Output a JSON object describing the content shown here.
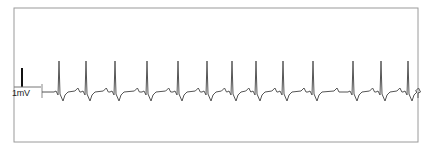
{
  "chart_data": {
    "type": "line",
    "title": "",
    "xlabel": "",
    "ylabel": "",
    "calibration": {
      "label": "1mV",
      "height_px": 19
    },
    "grid": false,
    "legend": null,
    "frame": {
      "left": 14,
      "top": 8,
      "right": 418,
      "bottom": 142
    },
    "baseline_y": 92,
    "trace_start_x": 42,
    "trace_end_x": 418,
    "beats_x": [
      59,
      86,
      115,
      147,
      178,
      207,
      232,
      256,
      283,
      313,
      353,
      381,
      408
    ],
    "beat_morphology": {
      "r_peak_y": 61,
      "s_dip_y": 101,
      "t_wave_y": 88,
      "q_dip_y": 95
    },
    "beat_count": 13,
    "colors": {
      "trace": "#555555",
      "frame": "#9a9a9a",
      "calibration": "#111111"
    }
  },
  "labels": {
    "calibration": "1mV"
  }
}
